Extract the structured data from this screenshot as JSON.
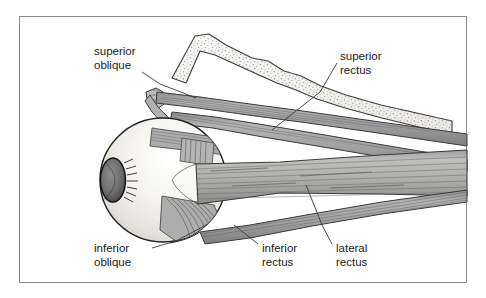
{
  "figure": {
    "frame_color": "#8a8a8a",
    "background_color": "#ffffff"
  },
  "labels": [
    {
      "id": "superior-oblique",
      "line1": "superior",
      "line2": "oblique",
      "position": "top-left"
    },
    {
      "id": "superior-rectus",
      "line1": "superior",
      "line2": "rectus",
      "position": "top-right"
    },
    {
      "id": "inferior-oblique",
      "line1": "inferior",
      "line2": "oblique",
      "position": "bottom-left"
    },
    {
      "id": "inferior-rectus",
      "line1": "inferior",
      "line2": "rectus",
      "position": "bottom-center"
    },
    {
      "id": "lateral-rectus",
      "line1": "lateral",
      "line2": "rectus",
      "position": "bottom-right"
    }
  ],
  "structures": [
    {
      "id": "orbital-bone",
      "name": "orbital bone",
      "texture": "stippled",
      "fill": "#f2f2f0"
    },
    {
      "id": "eyeball",
      "name": "eyeball sclera",
      "fill": "#f0efe9"
    },
    {
      "id": "iris",
      "name": "iris and cornea",
      "fill": "#6e6e6e"
    },
    {
      "id": "superior-oblique-muscle",
      "name": "superior oblique muscle",
      "fill": "#9a9a9a"
    },
    {
      "id": "superior-rectus-muscle",
      "name": "superior rectus muscle",
      "fill": "#9a9a9a"
    },
    {
      "id": "lateral-rectus-muscle",
      "name": "lateral rectus muscle",
      "fill": "#aaaaaa"
    },
    {
      "id": "inferior-rectus-muscle",
      "name": "inferior rectus muscle",
      "fill": "#9a9a9a"
    },
    {
      "id": "inferior-oblique-muscle",
      "name": "inferior oblique muscle",
      "fill": "#a5a5a5"
    }
  ],
  "colors": {
    "muscle_gray": "#a5a5a5",
    "muscle_dark": "#6f6f6f",
    "bone_fill": "#f2f2f0",
    "sclera": "#f0efe9",
    "outline": "#2b2b2b",
    "leader_line": "#3a3a3a",
    "text": "#1a1a1a"
  }
}
